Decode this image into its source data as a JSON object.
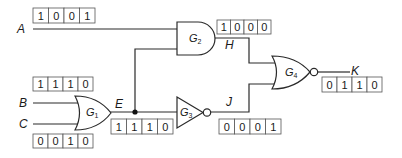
{
  "diagram": {
    "type": "logic-circuit",
    "inputs": [
      {
        "name": "A",
        "bits": [
          "1",
          "0",
          "0",
          "1"
        ]
      },
      {
        "name": "B",
        "bits": [
          "1",
          "1",
          "1",
          "0"
        ]
      },
      {
        "name": "C",
        "bits": [
          "0",
          "0",
          "1",
          "0"
        ]
      }
    ],
    "gates": [
      {
        "id": "G1",
        "letter": "G",
        "sub": "1",
        "type": "OR",
        "inputs": [
          "B",
          "C"
        ],
        "output": "E"
      },
      {
        "id": "G2",
        "letter": "G",
        "sub": "2",
        "type": "AND",
        "inputs": [
          "A",
          "E"
        ],
        "output": "H"
      },
      {
        "id": "G3",
        "letter": "G",
        "sub": "3",
        "type": "NOT",
        "inputs": [
          "E"
        ],
        "output": "J"
      },
      {
        "id": "G4",
        "letter": "G",
        "sub": "4",
        "type": "NOR",
        "inputs": [
          "H",
          "J"
        ],
        "output": "K"
      }
    ],
    "signals": {
      "A": {
        "label": "A",
        "bits": [
          "1",
          "0",
          "0",
          "1"
        ]
      },
      "B": {
        "label": "B",
        "bits": [
          "1",
          "1",
          "1",
          "0"
        ]
      },
      "C": {
        "label": "C",
        "bits": [
          "0",
          "0",
          "1",
          "0"
        ]
      },
      "E": {
        "label": "E",
        "bits": [
          "1",
          "1",
          "1",
          "0"
        ]
      },
      "H": {
        "label": "H",
        "bits": [
          "1",
          "0",
          "0",
          "0"
        ]
      },
      "J": {
        "label": "J",
        "bits": [
          "0",
          "0",
          "0",
          "1"
        ]
      },
      "K": {
        "label": "K",
        "bits": [
          "0",
          "1",
          "1",
          "0"
        ]
      }
    },
    "colors": {
      "line": "#2a2a2a",
      "text": "#1a1a1a",
      "box_border": "#555555"
    }
  }
}
